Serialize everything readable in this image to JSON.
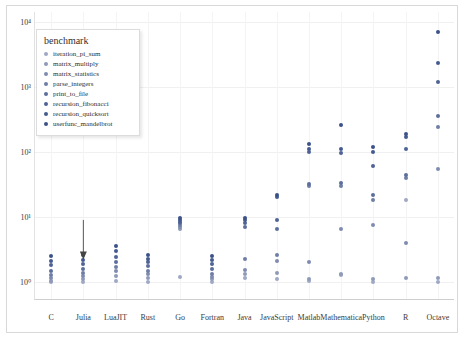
{
  "chart_data": {
    "type": "scatter",
    "title": "",
    "xlabel": "",
    "ylabel": "",
    "yscale": "log",
    "ylim": [
      0.55,
      14000
    ],
    "grid": true,
    "legend_position": "upper-left",
    "legend_title": "benchmark",
    "ytick_labels": [
      "10⁰",
      "10¹",
      "10²",
      "10³",
      "10⁴"
    ],
    "ytick_values": [
      1,
      10,
      100,
      1000,
      10000
    ],
    "categories": [
      "C",
      "Julia",
      "LuaJIT",
      "Rust",
      "Go",
      "Fortran",
      "Java",
      "JavaScript",
      "Matlab",
      "Mathematica",
      "Python",
      "R",
      "Octave"
    ],
    "series": [
      {
        "name": "iteration_pi_sum",
        "color": "#9fa8c4",
        "points": [
          {
            "x": "C",
            "y": 1.0
          },
          {
            "x": "Julia",
            "y": 1.0
          },
          {
            "x": "LuaJIT",
            "y": 1.05
          },
          {
            "x": "Rust",
            "y": 1.0
          },
          {
            "x": "Go",
            "y": 1.2
          },
          {
            "x": "Fortran",
            "y": 1.0
          },
          {
            "x": "Java",
            "y": 1.15
          },
          {
            "x": "JavaScript",
            "y": 1.1
          },
          {
            "x": "Matlab",
            "y": 1.05
          },
          {
            "x": "Mathematica",
            "y": 1.3
          },
          {
            "x": "Python",
            "y": 1.0
          },
          {
            "x": "R",
            "y": 18.0
          },
          {
            "x": "Octave",
            "y": 1.0
          }
        ]
      },
      {
        "name": "matrix_multiply",
        "color": "#8e9ab8",
        "points": [
          {
            "x": "C",
            "y": 1.05
          },
          {
            "x": "Julia",
            "y": 1.1
          },
          {
            "x": "LuaJIT",
            "y": 1.25
          },
          {
            "x": "Rust",
            "y": 1.15
          },
          {
            "x": "Go",
            "y": 6.5
          },
          {
            "x": "Fortran",
            "y": 1.1
          },
          {
            "x": "Java",
            "y": 1.35
          },
          {
            "x": "JavaScript",
            "y": 1.4
          },
          {
            "x": "Matlab",
            "y": 1.1
          },
          {
            "x": "Mathematica",
            "y": 1.35
          },
          {
            "x": "Python",
            "y": 1.1
          },
          {
            "x": "R",
            "y": 1.15
          },
          {
            "x": "Octave",
            "y": 1.15
          }
        ]
      },
      {
        "name": "matrix_statistics",
        "color": "#7f8cb0",
        "points": [
          {
            "x": "C",
            "y": 1.15
          },
          {
            "x": "Julia",
            "y": 1.25
          },
          {
            "x": "LuaJIT",
            "y": 1.5
          },
          {
            "x": "Rust",
            "y": 1.35
          },
          {
            "x": "Go",
            "y": 7.0
          },
          {
            "x": "Fortran",
            "y": 1.2
          },
          {
            "x": "Java",
            "y": 1.55
          },
          {
            "x": "JavaScript",
            "y": 2.1
          },
          {
            "x": "Matlab",
            "y": 2.0
          },
          {
            "x": "Mathematica",
            "y": 6.5
          },
          {
            "x": "Python",
            "y": 7.5
          },
          {
            "x": "R",
            "y": 4.0
          },
          {
            "x": "Octave",
            "y": 55.0
          }
        ]
      },
      {
        "name": "parse_integers",
        "color": "#6f7ea6",
        "points": [
          {
            "x": "C",
            "y": 1.3
          },
          {
            "x": "Julia",
            "y": 1.4
          },
          {
            "x": "LuaJIT",
            "y": 1.7
          },
          {
            "x": "Rust",
            "y": 1.5
          },
          {
            "x": "Go",
            "y": 7.5
          },
          {
            "x": "Fortran",
            "y": 1.35
          },
          {
            "x": "Java",
            "y": 2.3
          },
          {
            "x": "JavaScript",
            "y": 2.6
          },
          {
            "x": "Matlab",
            "y": 30.0
          },
          {
            "x": "Mathematica",
            "y": 30.0
          },
          {
            "x": "Python",
            "y": 18.0
          },
          {
            "x": "R",
            "y": 40.0
          },
          {
            "x": "Octave",
            "y": 240.0
          }
        ]
      },
      {
        "name": "print_to_file",
        "color": "#5c6e9c",
        "points": [
          {
            "x": "C",
            "y": 1.5
          },
          {
            "x": "Julia",
            "y": 1.6
          },
          {
            "x": "LuaJIT",
            "y": 2.0
          },
          {
            "x": "Rust",
            "y": 1.75
          },
          {
            "x": "Go",
            "y": 8.0
          },
          {
            "x": "Fortran",
            "y": 1.6
          },
          {
            "x": "Java",
            "y": 7.0
          },
          {
            "x": "JavaScript",
            "y": 6.5
          },
          {
            "x": "Matlab",
            "y": 32.0
          },
          {
            "x": "Mathematica",
            "y": 33.0
          },
          {
            "x": "Python",
            "y": 22.0
          },
          {
            "x": "R",
            "y": 44.0
          },
          {
            "x": "Octave",
            "y": 350.0
          }
        ]
      },
      {
        "name": "recursion_fibonacci",
        "color": "#4f6396",
        "points": [
          {
            "x": "C",
            "y": 1.8
          },
          {
            "x": "Julia",
            "y": 1.9
          },
          {
            "x": "LuaJIT",
            "y": 2.4
          },
          {
            "x": "Rust",
            "y": 2.0
          },
          {
            "x": "Go",
            "y": 8.5
          },
          {
            "x": "Fortran",
            "y": 1.9
          },
          {
            "x": "Java",
            "y": 8.0
          },
          {
            "x": "JavaScript",
            "y": 9.0
          },
          {
            "x": "Matlab",
            "y": 100.0
          },
          {
            "x": "Mathematica",
            "y": 95.0
          },
          {
            "x": "Python",
            "y": 60.0
          },
          {
            "x": "R",
            "y": 110.0
          },
          {
            "x": "Octave",
            "y": 1200.0
          }
        ]
      },
      {
        "name": "recursion_quicksort",
        "color": "#445a90",
        "points": [
          {
            "x": "C",
            "y": 2.1
          },
          {
            "x": "Julia",
            "y": 2.2
          },
          {
            "x": "LuaJIT",
            "y": 3.0
          },
          {
            "x": "Rust",
            "y": 2.3
          },
          {
            "x": "Go",
            "y": 9.0
          },
          {
            "x": "Fortran",
            "y": 2.2
          },
          {
            "x": "Java",
            "y": 9.0
          },
          {
            "x": "JavaScript",
            "y": 20.0
          },
          {
            "x": "Matlab",
            "y": 110.0
          },
          {
            "x": "Mathematica",
            "y": 110.0
          },
          {
            "x": "Python",
            "y": 100.0
          },
          {
            "x": "R",
            "y": 170.0
          },
          {
            "x": "Octave",
            "y": 2300.0
          }
        ]
      },
      {
        "name": "userfunc_mandelbrot",
        "color": "#3b5288",
        "points": [
          {
            "x": "C",
            "y": 2.5
          },
          {
            "x": "Julia",
            "y": 2.6
          },
          {
            "x": "LuaJIT",
            "y": 3.6
          },
          {
            "x": "Rust",
            "y": 2.6
          },
          {
            "x": "Go",
            "y": 9.5
          },
          {
            "x": "Fortran",
            "y": 2.5
          },
          {
            "x": "Java",
            "y": 9.5
          },
          {
            "x": "JavaScript",
            "y": 22.0
          },
          {
            "x": "Matlab",
            "y": 130.0
          },
          {
            "x": "Mathematica",
            "y": 260.0
          },
          {
            "x": "Python",
            "y": 120.0
          },
          {
            "x": "R",
            "y": 190.0
          },
          {
            "x": "Octave",
            "y": 7000.0
          }
        ]
      }
    ],
    "annotations": [
      {
        "name": "julia-arrow",
        "target_category": "Julia",
        "target_y": 2.3,
        "from_y": 9.0
      }
    ]
  }
}
